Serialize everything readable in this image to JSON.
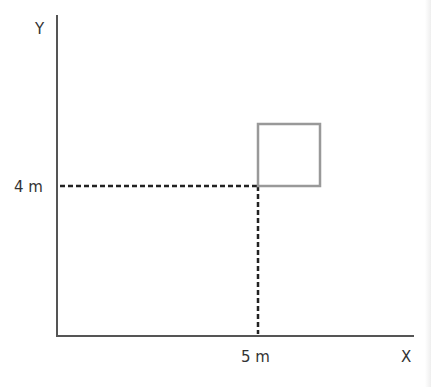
{
  "diagram": {
    "axes": {
      "x_label": "X",
      "y_label": "Y"
    },
    "ticks": {
      "x_tick_label": "5 m",
      "y_tick_label": "4 m"
    },
    "point": {
      "x": 5,
      "y": 4,
      "unit": "m"
    },
    "square": {
      "description": "square with lower-left corner at (5 m, 4 m)"
    },
    "colors": {
      "axis": "#555555",
      "dashed_guides": "#222222",
      "square": "#999999",
      "text": "#333333"
    }
  }
}
